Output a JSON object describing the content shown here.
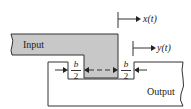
{
  "diagram": {
    "input_label": "Input",
    "output_label": "Output",
    "x_signal_label": "x(t)",
    "y_signal_label": "y(t)",
    "gap_left": {
      "numerator": "b",
      "denominator": "2"
    },
    "gap_right": {
      "numerator": "b",
      "denominator": "2"
    },
    "colors": {
      "input_fill": "#c8c8c8",
      "stroke": "#333333",
      "background": "#ffffff"
    }
  }
}
